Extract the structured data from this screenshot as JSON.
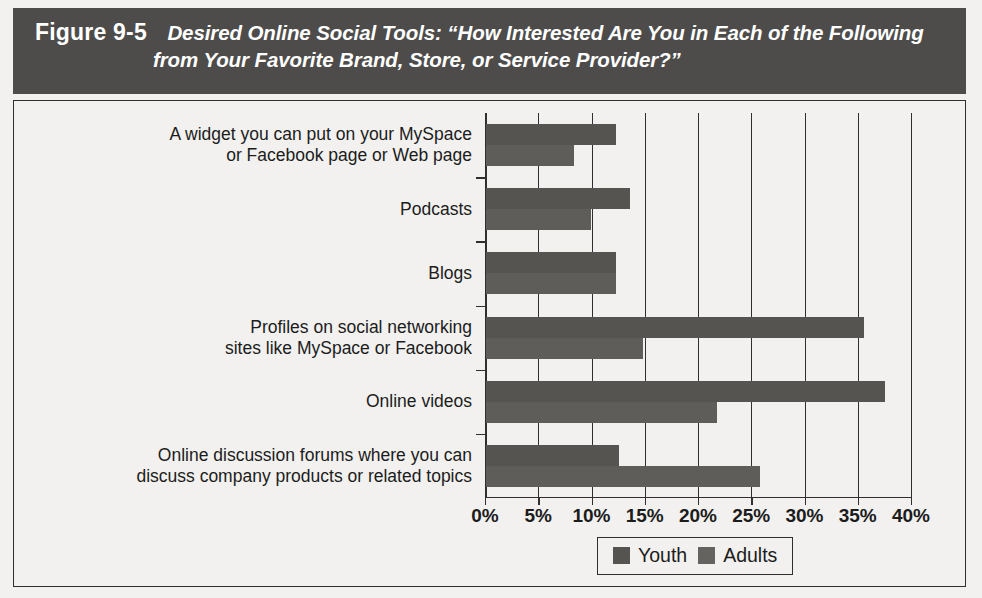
{
  "figure": {
    "number_label": "Figure 9-5",
    "caption_line_1": "Desired Online Social Tools: “How Interested Are You in Each of the Following",
    "caption_line_2": "from Your Favorite Brand, Store, or Service Provider?”",
    "header_background": "#4d4c4a",
    "header_text_color": "#ffffff",
    "panel_background": "#f2f1ef",
    "border_color": "#2f2f2f"
  },
  "chart_data": {
    "type": "bar",
    "orientation": "horizontal",
    "title": "Desired Online Social Tools: “How Interested Are You in Each of the Following from Your Favorite Brand, Store, or Service Provider?”",
    "xlabel": "",
    "ylabel": "",
    "xlim": [
      0,
      40
    ],
    "xticks": [
      0,
      5,
      10,
      15,
      20,
      25,
      30,
      35,
      40
    ],
    "xtick_labels": [
      "0%",
      "5%",
      "10%",
      "15%",
      "20%",
      "25%",
      "30%",
      "35%",
      "40%"
    ],
    "grid": "vertical",
    "legend_position": "bottom-center",
    "categories": [
      "A widget you can put on your MySpace or Facebook page or Web page",
      "Podcasts",
      "Blogs",
      "Profiles on social networking sites like MySpace or Facebook",
      "Online videos",
      "Online discussion forums where you can discuss company products or related topics"
    ],
    "category_lines": [
      [
        "A widget you can put on your MySpace",
        "or Facebook page or Web page"
      ],
      [
        "Podcasts"
      ],
      [
        "Blogs"
      ],
      [
        "Profiles on social networking",
        "sites like MySpace or Facebook"
      ],
      [
        "Online videos"
      ],
      [
        "Online discussion forums where you can",
        "discuss company products or related topics"
      ]
    ],
    "series": [
      {
        "name": "Youth",
        "color": "#565451",
        "values": [
          12.2,
          13.5,
          12.2,
          35.5,
          37.5,
          12.5
        ]
      },
      {
        "name": "Adults",
        "color": "#5f5d5a",
        "values": [
          8.3,
          9.9,
          12.2,
          14.7,
          21.7,
          25.7
        ]
      }
    ]
  },
  "legend": {
    "items": [
      {
        "label": "Youth",
        "color": "#565451"
      },
      {
        "label": "Adults",
        "color": "#656360"
      }
    ]
  }
}
